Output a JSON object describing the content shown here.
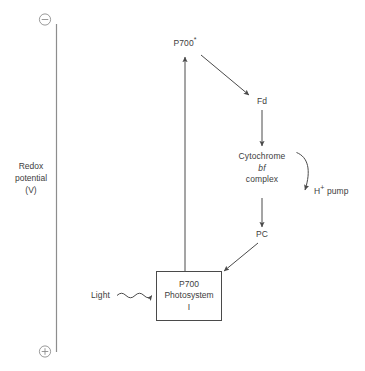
{
  "figure": {
    "kind": "photosystem-i-cyclic-electron-flow-diagram",
    "background": "#ffffff",
    "line_color": "#4a4a4a",
    "text_color": "#3d3d3d"
  },
  "axis": {
    "name": "redox-potential-axis",
    "caption_line1": "Redox",
    "caption_line2": "potential",
    "caption_line3": "(V)",
    "top_marker": "−",
    "bottom_marker": "+",
    "top_marker_name": "negative-sign",
    "bottom_marker_name": "positive-sign"
  },
  "nodes": {
    "p700_excited": {
      "label": "P700",
      "superscript": "*"
    },
    "fd": {
      "label": "Fd"
    },
    "cytochrome": {
      "line1": "Cytochrome",
      "line2": "bf",
      "line3": "complex"
    },
    "h_pump": {
      "label": "H",
      "superscript": "+",
      "suffix": " pump"
    },
    "pc": {
      "label": "PC"
    },
    "light": {
      "label": "Light"
    },
    "photosystem_box": {
      "line1": "P700",
      "line2": "Photosystem",
      "line3": "I"
    }
  },
  "arrows": [
    {
      "name": "arrow-photosystem-to-p700-excited",
      "from": "photosystem-i-box",
      "to": "p700-excited",
      "style": "straight-vertical"
    },
    {
      "name": "arrow-p700-excited-to-fd",
      "from": "p700-excited",
      "to": "fd",
      "style": "straight-diagonal"
    },
    {
      "name": "arrow-fd-to-cytochrome",
      "from": "fd",
      "to": "cytochrome-bf-complex",
      "style": "straight-vertical"
    },
    {
      "name": "arrow-cytochrome-to-h-pump",
      "from": "cytochrome-bf-complex",
      "to": "h-pump",
      "style": "curved"
    },
    {
      "name": "arrow-cytochrome-to-pc",
      "from": "cytochrome-bf-complex",
      "to": "pc",
      "style": "straight-vertical"
    },
    {
      "name": "arrow-pc-to-photosystem",
      "from": "pc",
      "to": "photosystem-i-box",
      "style": "straight-diagonal"
    },
    {
      "name": "arrow-light-to-photosystem",
      "from": "light",
      "to": "photosystem-i-box",
      "style": "wavy"
    }
  ]
}
